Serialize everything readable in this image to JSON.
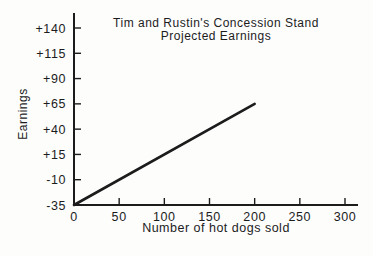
{
  "chart_data": {
    "type": "line",
    "title_lines": [
      "Tim and Rustin's Concession Stand",
      "Projected Earnings"
    ],
    "xlabel": "Number of hot dogs sold",
    "ylabel": "Earnings",
    "xlim": [
      0,
      300
    ],
    "ylim": [
      -35,
      140
    ],
    "grid": false,
    "legend": "none",
    "ink_color": "#1c1c1c",
    "background_color": "#fdfdfc",
    "x_ticks": [
      {
        "value": 0,
        "label": "0"
      },
      {
        "value": 50,
        "label": "50"
      },
      {
        "value": 100,
        "label": "100"
      },
      {
        "value": 150,
        "label": "150"
      },
      {
        "value": 200,
        "label": "200"
      },
      {
        "value": 250,
        "label": "250"
      },
      {
        "value": 300,
        "label": "300"
      }
    ],
    "y_ticks": [
      {
        "value": 140,
        "label": "+140"
      },
      {
        "value": 115,
        "label": "+115"
      },
      {
        "value": 90,
        "label": "+90"
      },
      {
        "value": 65,
        "label": "+65"
      },
      {
        "value": 40,
        "label": "+40"
      },
      {
        "value": 15,
        "label": "+15"
      },
      {
        "value": -10,
        "label": "-10"
      },
      {
        "value": -35,
        "label": "-35"
      }
    ],
    "series": [
      {
        "name": "projected-earnings",
        "points": [
          [
            0,
            -35
          ],
          [
            200,
            65
          ]
        ]
      }
    ]
  }
}
